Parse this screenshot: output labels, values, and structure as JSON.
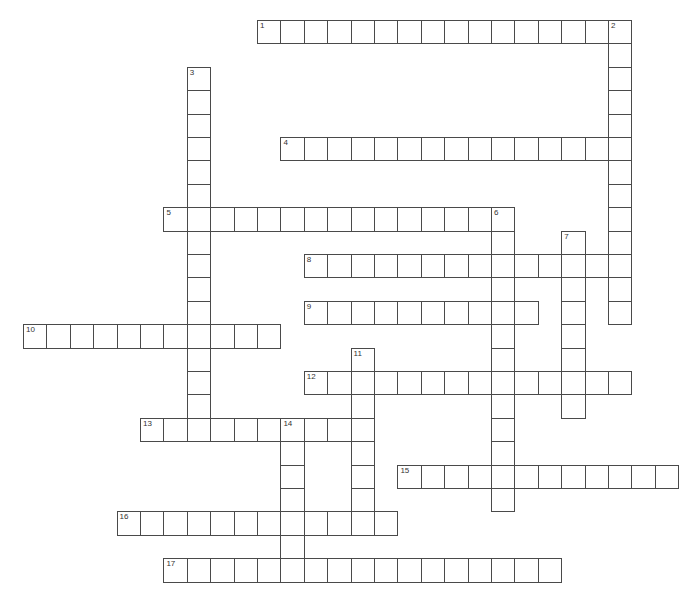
{
  "puzzle": {
    "grid_origin": {
      "x": 23,
      "y": 20
    },
    "cell_size": 23.4,
    "border_color": "#4a4a4a",
    "background": "#ffffff",
    "entries": [
      {
        "number": "1",
        "direction": "across",
        "row": 0,
        "col": 10,
        "length": 16
      },
      {
        "number": "2",
        "direction": "down",
        "row": 0,
        "col": 25,
        "length": 13
      },
      {
        "number": "3",
        "direction": "down",
        "row": 2,
        "col": 7,
        "length": 16
      },
      {
        "number": "4",
        "direction": "across",
        "row": 5,
        "col": 11,
        "length": 15
      },
      {
        "number": "5",
        "direction": "across",
        "row": 8,
        "col": 6,
        "length": 15
      },
      {
        "number": "6",
        "direction": "down",
        "row": 8,
        "col": 20,
        "length": 13
      },
      {
        "number": "7",
        "direction": "down",
        "row": 9,
        "col": 23,
        "length": 8
      },
      {
        "number": "8",
        "direction": "across",
        "row": 10,
        "col": 12,
        "length": 14
      },
      {
        "number": "9",
        "direction": "across",
        "row": 12,
        "col": 12,
        "length": 10
      },
      {
        "number": "10",
        "direction": "across",
        "row": 13,
        "col": 0,
        "length": 11
      },
      {
        "number": "11",
        "direction": "down",
        "row": 14,
        "col": 14,
        "length": 8
      },
      {
        "number": "12",
        "direction": "across",
        "row": 15,
        "col": 12,
        "length": 14
      },
      {
        "number": "13",
        "direction": "across",
        "row": 17,
        "col": 5,
        "length": 10
      },
      {
        "number": "14",
        "direction": "down",
        "row": 17,
        "col": 11,
        "length": 7
      },
      {
        "number": "15",
        "direction": "across",
        "row": 19,
        "col": 16,
        "length": 12
      },
      {
        "number": "16",
        "direction": "across",
        "row": 21,
        "col": 4,
        "length": 12
      },
      {
        "number": "17",
        "direction": "across",
        "row": 23,
        "col": 6,
        "length": 17
      }
    ]
  }
}
